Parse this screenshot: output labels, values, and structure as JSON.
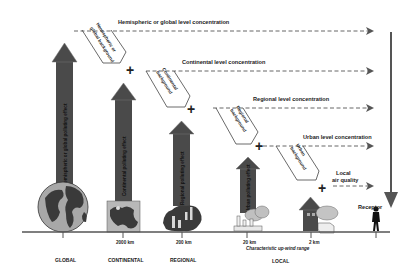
{
  "diagram": {
    "type": "air-quality-scale-contributions",
    "colors": {
      "arrow_fill": "#4a4a4a",
      "arrow_outline": "#6a6a6a",
      "line": "#555555",
      "dash": "#666666",
      "text": "#222222",
      "earth_land": "#3a3a3a",
      "earth_sea": "#a8a8a8"
    },
    "concentration_levels": [
      {
        "id": "hemispheric",
        "label": "Hemispheric or global level concentration"
      },
      {
        "id": "continental",
        "label": "Continental level concentration"
      },
      {
        "id": "regional",
        "label": "Regional level concentration"
      },
      {
        "id": "urban",
        "label": "Urban level concentration"
      },
      {
        "id": "local",
        "label_line1": "Local",
        "label_line2": "air quality"
      }
    ],
    "backgrounds": [
      {
        "id": "hemispheric",
        "line1": "Hemispheric or",
        "line2": "global background"
      },
      {
        "id": "continental",
        "line1": "Continental",
        "line2": "background"
      },
      {
        "id": "regional",
        "line1": "Regional",
        "line2": "background"
      },
      {
        "id": "urban",
        "line1": "Urban",
        "line2": "background"
      }
    ],
    "plus_symbol": "+",
    "pollution_arrows": [
      {
        "id": "global",
        "label": "Hemispheric or global polluting effect"
      },
      {
        "id": "continental",
        "label": "Continental polluting effect"
      },
      {
        "id": "regional",
        "label": "Regional polluting effect"
      },
      {
        "id": "urban",
        "label": "Urban polluting effect"
      },
      {
        "id": "local",
        "label": "Local"
      }
    ],
    "axis": {
      "ticks": [
        {
          "id": "global",
          "distance": "",
          "scale": "GLOBAL"
        },
        {
          "id": "continental",
          "distance": "2000 km",
          "scale": "CONTINENTAL"
        },
        {
          "id": "regional",
          "distance": "200 km",
          "scale": "REGIONAL"
        },
        {
          "id": "urban",
          "distance": "20 km",
          "scale": ""
        },
        {
          "id": "local",
          "distance": "2 km",
          "scale": ""
        },
        {
          "id": "receptor",
          "distance": "",
          "scale": ""
        }
      ],
      "range_caption": "Characteristic up-wind range",
      "local_scale": "LOCAL"
    },
    "receptor_label": "Receptor",
    "icons": [
      "globe-icon",
      "continent-map-icon",
      "regional-map-icon",
      "factory-icon",
      "house-icon",
      "person-icon"
    ]
  }
}
